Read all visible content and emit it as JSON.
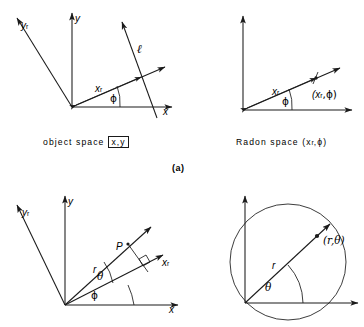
{
  "figure": {
    "panel_letter": "(a)",
    "captions": {
      "object_space": "object  space",
      "object_space_bracket": "x,y",
      "radon_space": "Radon  space (x",
      "radon_space_sub": "r",
      "radon_space_tail": ",ϕ)"
    }
  },
  "panel_top_left": {
    "name": "object space",
    "axis_y": "y",
    "axis_x": "x",
    "axis_yr": "y",
    "axis_yr_sub": "r",
    "label_xr": "x",
    "label_xr_sub": "r",
    "label_line": "ℓ",
    "angle_phi": "ϕ"
  },
  "panel_top_right": {
    "name": "Radon space",
    "label_xr": "x",
    "label_xr_sub": "r",
    "angle_phi": "ϕ",
    "point_label": "(x",
    "point_label_sub": "r",
    "point_label_tail": ",ϕ)"
  },
  "panel_bottom_left": {
    "name": "object space polar",
    "axis_y": "y",
    "axis_x": "x",
    "axis_yr": "y",
    "axis_yr_sub": "r",
    "axis_xr": "x",
    "axis_xr_sub": "r",
    "point_p": "P",
    "label_r": "r",
    "angle_theta": "θ",
    "angle_phi": "ϕ"
  },
  "panel_bottom_right": {
    "name": "polar space",
    "label_r": "r",
    "angle_theta": "θ",
    "point_label": "(r,θ)"
  }
}
